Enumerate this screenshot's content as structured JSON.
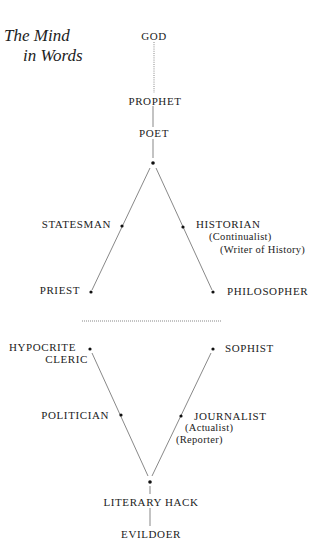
{
  "title": {
    "line1": "The Mind",
    "line2": "in Words"
  },
  "upper": {
    "god": "GOD",
    "prophet": "PROPHET",
    "poet": "POET",
    "statesman": "STATESMAN",
    "historian": "HISTORIAN",
    "historian_sub1": "(Continualist)",
    "historian_sub2": "(Writer of History)",
    "priest": "PRIEST",
    "philosopher": "PHILOSOPHER"
  },
  "lower": {
    "hypocrite": "HYPOCRITE",
    "cleric": "CLERIC",
    "sophist": "SOPHIST",
    "politician": "POLITICIAN",
    "journalist": "JOURNALIST",
    "journalist_sub1": "(Actualist)",
    "journalist_sub2": "(Reporter)",
    "literary_hack": "LITERARY HACK",
    "evildoer": "EVILDOER"
  },
  "colors": {
    "ink": "#222222",
    "background": "#ffffff"
  }
}
